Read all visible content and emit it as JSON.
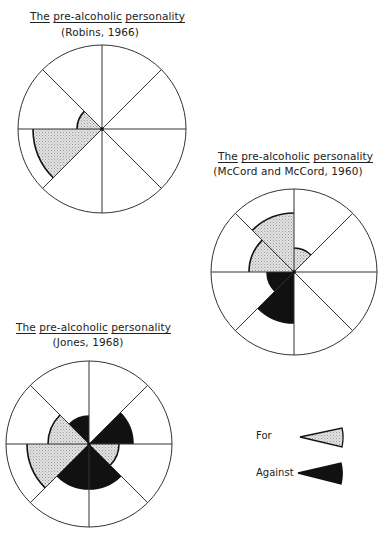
{
  "diagrams": [
    {
      "title_words": [
        "The",
        "pre-alcoholic",
        "personality"
      ],
      "subtitle": "(Robins, 1966)",
      "center": [
        102,
        129
      ],
      "radius": 84,
      "title_pos": [
        100,
        10
      ],
      "subtitle_pos": [
        100,
        26
      ],
      "wedges": [
        {
          "from": 270,
          "to": 315,
          "r": 25,
          "type": "for"
        },
        {
          "from": 225,
          "to": 270,
          "r": 69,
          "type": "for"
        }
      ]
    },
    {
      "title_words": [
        "The",
        "pre-alcoholic",
        "personality"
      ],
      "subtitle": "(McCord and McCord, 1960)",
      "center": [
        294,
        272
      ],
      "radius": 83,
      "title_pos": [
        288,
        150
      ],
      "subtitle_pos": [
        288,
        165
      ],
      "wedges": [
        {
          "from": 0,
          "to": 45,
          "r": 24,
          "type": "for"
        },
        {
          "from": 315,
          "to": 360,
          "r": 59,
          "type": "for"
        },
        {
          "from": 270,
          "to": 315,
          "r": 45,
          "type": "for"
        },
        {
          "from": 225,
          "to": 270,
          "r": 27,
          "type": "against"
        },
        {
          "from": 180,
          "to": 225,
          "r": 51,
          "type": "against"
        }
      ]
    },
    {
      "title_words": [
        "The",
        "pre-alcoholic",
        "personality"
      ],
      "subtitle": "(Jones, 1968)",
      "center": [
        89,
        444
      ],
      "radius": 83,
      "title_pos": [
        86,
        321
      ],
      "subtitle_pos": [
        88,
        336
      ],
      "wedges": [
        {
          "from": 315,
          "to": 360,
          "r": 28,
          "type": "against"
        },
        {
          "from": 45,
          "to": 90,
          "r": 44,
          "type": "against"
        },
        {
          "from": 90,
          "to": 135,
          "r": 30,
          "type": "for"
        },
        {
          "from": 135,
          "to": 180,
          "r": 45,
          "type": "against"
        },
        {
          "from": 180,
          "to": 225,
          "r": 45,
          "type": "against"
        },
        {
          "from": 225,
          "to": 270,
          "r": 62,
          "type": "for"
        },
        {
          "from": 270,
          "to": 315,
          "r": 41,
          "type": "for"
        }
      ]
    }
  ],
  "legend": {
    "items": [
      {
        "label": "For",
        "type": "for",
        "label_pos": [
          256,
          430
        ],
        "wedge": [
          300,
          437,
          342,
          428,
          342,
          447
        ]
      },
      {
        "label": "Against",
        "type": "against",
        "label_pos": [
          256,
          467
        ],
        "wedge": [
          298,
          473,
          341,
          463,
          341,
          484
        ]
      }
    ]
  },
  "colors": {
    "for_fill": "#d8d8d8",
    "against_fill": "#111111",
    "line": "#333333",
    "background": "#ffffff"
  }
}
